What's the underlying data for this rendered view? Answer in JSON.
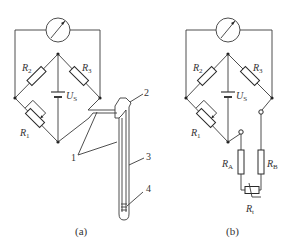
{
  "figure": {
    "panels": [
      {
        "id": "a",
        "caption": "(a)",
        "labels": {
          "r2": "R",
          "r2_sub": "2",
          "r3": "R",
          "r3_sub": "3",
          "r1": "R",
          "r1_sub": "1",
          "us": "U",
          "us_sub": "S"
        },
        "callouts": [
          "1",
          "2",
          "3",
          "4"
        ]
      },
      {
        "id": "b",
        "caption": "(b)",
        "labels": {
          "r2": "R",
          "r2_sub": "2",
          "r3": "R",
          "r3_sub": "3",
          "r1": "R",
          "r1_sub": "1",
          "us": "U",
          "us_sub": "S",
          "ra": "R",
          "ra_sub": "A",
          "rb": "R",
          "rb_sub": "B",
          "rt": "R",
          "rt_sub": "t"
        }
      }
    ],
    "components": {
      "meter": "galvanometer-icon",
      "source": "battery-icon",
      "resistor": "resistor-icon",
      "variable_resistor": "potentiometer-icon",
      "sensor": "thermal-probe-icon"
    }
  }
}
